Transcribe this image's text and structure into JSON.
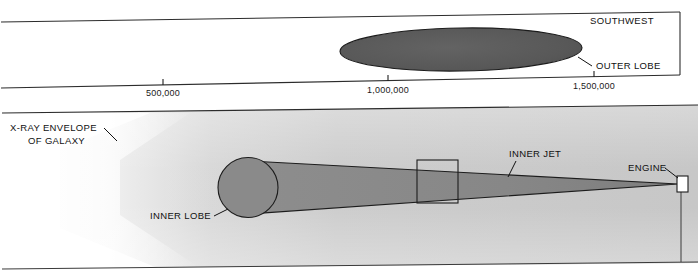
{
  "figure": {
    "title": "",
    "orientation_label": "SOUTHWEST",
    "panels": [
      {
        "id": "outer-panel",
        "name": "outer-scale-panel",
        "labels": [
          "SOUTHWEST",
          "OUTER LOBE"
        ],
        "axis": {
          "name": "distance-scale-axis",
          "unit_note": "",
          "ticks": [
            {
              "label": "500,000",
              "x": 163,
              "value": 500000
            },
            {
              "label": "1,000,000",
              "x": 388,
              "value": 1000000
            },
            {
              "label": "1,500,000",
              "x": 594,
              "value": 1500000
            }
          ]
        },
        "features": [
          {
            "name": "outer-lobe",
            "label": "OUTER LOBE",
            "shape": "ellipse",
            "fill": "#595959"
          }
        ]
      },
      {
        "id": "inner-panel",
        "name": "inner-detail-panel",
        "labels": [
          "X-RAY ENVELOPE",
          "OF GALAXY",
          "INNER LOBE",
          "INNER JET",
          "ENGINE"
        ],
        "features": [
          {
            "name": "x-ray-envelope",
            "label_line1": "X-RAY ENVELOPE",
            "label_line2": "OF GALAXY",
            "shape": "gradient-wedge",
            "fill": "#c9c9c9"
          },
          {
            "name": "inner-lobe",
            "label": "INNER LOBE",
            "shape": "circle-cylinder",
            "fill": "#8a8a8a"
          },
          {
            "name": "inner-jet",
            "label": "INNER JET",
            "shape": "tapered-cone",
            "fill": "#8a8a8a"
          },
          {
            "name": "engine",
            "label": "ENGINE",
            "shape": "small-rectangle",
            "fill": "#ffffff"
          },
          {
            "name": "detail-box",
            "label": "",
            "shape": "rectangle-outline",
            "fill": "none"
          }
        ]
      }
    ],
    "text": {
      "southwest": "SOUTHWEST",
      "outer_lobe": "OUTER LOBE",
      "xray_envelope_l1": "X-RAY ENVELOPE",
      "xray_envelope_l2": "OF GALAXY",
      "inner_lobe": "INNER LOBE",
      "inner_jet": "INNER JET",
      "engine": "ENGINE",
      "tick_500k": "500,000",
      "tick_1m": "1,000,000",
      "tick_1_5m": "1,500,000"
    },
    "colors": {
      "outer_lobe_fill": "#595959",
      "inner_feature_fill": "#8a8a8a",
      "envelope_fill": "#c9c9c9",
      "line": "#1c1c1c",
      "page_background": "#ffffff"
    }
  }
}
